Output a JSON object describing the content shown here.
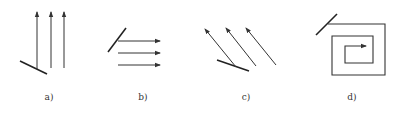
{
  "figure": {
    "panels": [
      {
        "id": "a",
        "label": "a)",
        "description": "Three vertical parallel arrows pointing up with an inclined mirror at bottom left",
        "label_x": 49
      },
      {
        "id": "b",
        "label": "b)",
        "description": "Three horizontal parallel arrows pointing right with an inclined mirror at left",
        "label_x": 143
      },
      {
        "id": "c",
        "label": "c)",
        "description": "Three diagonal parallel arrows pointing up-left with an inclined mirror at bottom",
        "label_x": 246
      },
      {
        "id": "d",
        "label": "d)",
        "description": "Rectangular inward spiral ending in an arrow pointing right, with an inclined line at top left",
        "label_x": 352
      }
    ]
  },
  "colors": {
    "stroke": "#333333",
    "mirror": "#222222",
    "background": "#ffffff"
  }
}
